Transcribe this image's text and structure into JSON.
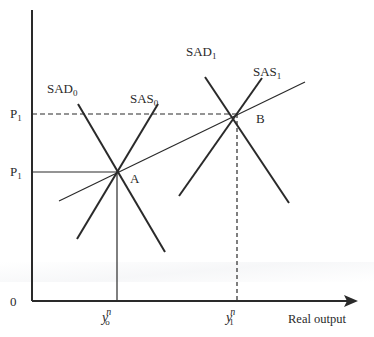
{
  "diagram": {
    "axes": {
      "origin_label": "0",
      "x_label": "Real output",
      "y_ticks": [
        {
          "label": "P",
          "sub": "1",
          "note": "upper price level (dashed to B)"
        },
        {
          "label": "P",
          "sub": "1",
          "note": "lower price level (solid to A)"
        }
      ],
      "x_ticks": [
        {
          "base": "y",
          "sup": "n",
          "sub": "o"
        },
        {
          "base": "y",
          "sup": "n",
          "sub": "1"
        }
      ]
    },
    "curves": {
      "sad0": {
        "label": "SAD",
        "sub": "0"
      },
      "sas0": {
        "label": "SAS",
        "sub": "0"
      },
      "sad1": {
        "label": "SAD",
        "sub": "1"
      },
      "sas1": {
        "label": "SAS",
        "sub": "1"
      }
    },
    "points": {
      "a": "A",
      "b": "B"
    },
    "colors": {
      "line": "#2a2a2a",
      "background": "#ffffff"
    }
  }
}
